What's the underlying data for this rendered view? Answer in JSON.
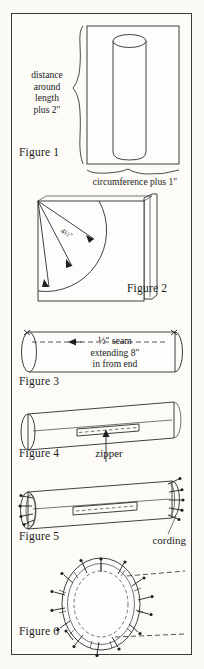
{
  "page": {
    "type": "sewing-instruction-diagram-plate",
    "background_color": "#fbfaf7",
    "ink_color": "#2b2b2b",
    "border_color": "#3a3a3a"
  },
  "figures": [
    {
      "id": "figure-1",
      "label": "Figure 1",
      "subject": "fabric rectangle wrapped around a bolster form cylinder",
      "annotations": [
        {
          "name": "left-brace-text",
          "text": "distance\naround\nlength\nplus 2″",
          "lines": [
            "distance",
            "around",
            "length",
            "plus 2″"
          ]
        },
        {
          "name": "bottom-brace-text",
          "text": "circumference plus 1″"
        }
      ]
    },
    {
      "id": "figure-2",
      "label": "Figure 2",
      "subject": "folded fabric square with compass arc for circular end pieces",
      "annotations": [
        {
          "name": "radius-measure",
          "text": "4½″"
        }
      ]
    },
    {
      "id": "figure-3",
      "label": "Figure 3",
      "subject": "tube of fabric stitched with center seam, ends left open",
      "annotations": [
        {
          "name": "seam-callout",
          "text": "½″ seam\nextending 8″\nin from end",
          "lines": [
            "½″ seam",
            "extending 8″",
            "in from end"
          ]
        }
      ]
    },
    {
      "id": "figure-4",
      "label": "Figure 4",
      "subject": "bolster tube with zipper basted into the center opening",
      "annotations": [
        {
          "name": "zipper-callout",
          "text": "zipper"
        }
      ]
    },
    {
      "id": "figure-5",
      "label": "Figure 5",
      "subject": "bolster tube with corded piping pinned to both ends",
      "annotations": [
        {
          "name": "cording-callout",
          "text": "cording"
        }
      ]
    },
    {
      "id": "figure-6",
      "label": "Figure 6",
      "subject": "circular end piece pinned to the corded tube end",
      "annotations": []
    }
  ],
  "labels": {
    "figure1": "Figure 1",
    "figure2": "Figure 2",
    "figure3": "Figure 3",
    "figure4": "Figure 4",
    "figure5": "Figure 5",
    "figure6": "Figure 6",
    "distance": "distance",
    "around": "around",
    "length": "length",
    "plus2": "plus 2″",
    "circumference": "circumference plus 1″",
    "radius": "4½″",
    "seam1": "½″ seam",
    "seam2": "extending 8″",
    "seam3": "in from end",
    "zipper": "zipper",
    "cording": "cording"
  }
}
